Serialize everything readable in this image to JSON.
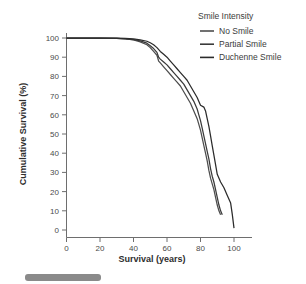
{
  "chart_data": {
    "type": "line",
    "title": "",
    "xlabel": "Survival (years)",
    "ylabel": "Cumulative Survival (%)",
    "xlim": [
      0,
      100
    ],
    "ylim": [
      0,
      100
    ],
    "xticks": [
      0,
      20,
      40,
      60,
      80,
      100
    ],
    "yticks": [
      0,
      10,
      20,
      30,
      40,
      50,
      60,
      70,
      80,
      90,
      100
    ],
    "grid": false,
    "legend_position": "top-right",
    "legend_title": "Smile Intensity",
    "series": [
      {
        "name": "No Smile",
        "color": "#4d4d4d",
        "x": [
          0,
          10,
          20,
          30,
          35,
          40,
          44,
          48,
          50,
          52,
          54,
          55,
          56,
          58,
          60,
          62,
          64,
          66,
          68,
          70,
          72,
          74,
          76,
          78,
          79,
          80,
          81,
          82,
          83,
          84,
          85,
          86,
          87,
          88,
          89,
          90,
          91,
          92
        ],
        "y": [
          100,
          100,
          100,
          99.8,
          99.5,
          99,
          98,
          96.5,
          95,
          93,
          91,
          88,
          87,
          85,
          83,
          81,
          79,
          77,
          75,
          72,
          69,
          66,
          62,
          58,
          55,
          52,
          48,
          44,
          40,
          36,
          31,
          27,
          24,
          21,
          17,
          13,
          10,
          8
        ]
      },
      {
        "name": "Partial Smile",
        "color": "#3a3a3a",
        "x": [
          0,
          10,
          20,
          30,
          35,
          40,
          44,
          48,
          50,
          52,
          54,
          55,
          56,
          58,
          60,
          62,
          64,
          66,
          68,
          70,
          72,
          74,
          76,
          78,
          79,
          80,
          81,
          82,
          83,
          84,
          85,
          86,
          87,
          88,
          89,
          90,
          91,
          92,
          93
        ],
        "y": [
          100,
          100,
          100,
          99.8,
          99.6,
          99.2,
          98.5,
          97.3,
          96,
          94.5,
          92.5,
          90,
          89,
          87.5,
          86,
          84,
          82,
          80,
          78,
          76,
          73,
          70,
          67,
          63,
          60,
          57,
          53,
          49,
          45,
          41,
          37,
          32,
          28,
          25,
          21,
          17,
          13,
          10,
          8
        ]
      },
      {
        "name": "Duchenne Smile",
        "color": "#2b2b2b",
        "x": [
          0,
          10,
          20,
          30,
          35,
          40,
          44,
          48,
          50,
          52,
          54,
          56,
          58,
          60,
          62,
          64,
          66,
          68,
          70,
          72,
          74,
          76,
          78,
          80,
          82,
          83,
          84,
          85,
          86,
          87,
          88,
          89,
          90,
          92,
          94,
          96,
          98,
          99,
          100
        ],
        "y": [
          100,
          100,
          100,
          99.9,
          99.8,
          99.5,
          99,
          98.3,
          97.5,
          96.5,
          95,
          93,
          91.5,
          90,
          88,
          86,
          84,
          82,
          80,
          78,
          75,
          72,
          69,
          65,
          64,
          62,
          58,
          54,
          49,
          44,
          39,
          34,
          29,
          25,
          22,
          18,
          14,
          8,
          1
        ]
      }
    ]
  },
  "axes": {
    "x_title": "Survival (years)",
    "y_title": "Cumulative Survival (%)",
    "x_tick_labels": [
      "0",
      "20",
      "40",
      "60",
      "80",
      "100"
    ],
    "y_tick_labels": [
      "0",
      "10",
      "20",
      "30",
      "40",
      "50",
      "60",
      "70",
      "80",
      "90",
      "100"
    ]
  },
  "legend": {
    "title": "Smile Intensity",
    "items": [
      {
        "label": "No Smile",
        "color": "#4d4d4d"
      },
      {
        "label": "Partial Smile",
        "color": "#3a3a3a"
      },
      {
        "label": "Duchenne Smile",
        "color": "#2b2b2b"
      }
    ]
  },
  "colors": {
    "background": "#ffffff",
    "axis": "#6e6e6e",
    "text": "#3b3b3b",
    "caption_bar": "#8a8a8a"
  }
}
